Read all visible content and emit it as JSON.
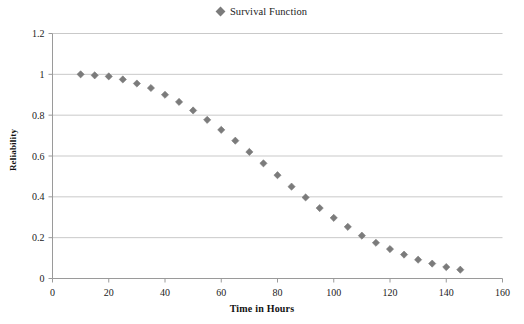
{
  "legend": {
    "entries": [
      {
        "label": "Survival Function",
        "marker": "diamond-marker-icon",
        "color": "#7b7b7b"
      }
    ]
  },
  "axes": {
    "x_title": "Time in Hours",
    "y_title": "Reliability"
  },
  "colors": {
    "marker": "#7b7b7b",
    "gridline": "#c9c9c9",
    "axis": "#9a9a9a",
    "text": "#222222",
    "background": "#ffffff"
  },
  "chart_data": {
    "type": "scatter",
    "title": "",
    "xlabel": "Time in Hours",
    "ylabel": "Reliability",
    "xlim": [
      0,
      160
    ],
    "ylim": [
      0,
      1.2
    ],
    "xticks": [
      0,
      20,
      40,
      60,
      80,
      100,
      120,
      140,
      160
    ],
    "yticks": [
      0,
      0.2,
      0.4,
      0.6,
      0.8,
      1,
      1.2
    ],
    "xtick_labels": [
      "0",
      "20",
      "40",
      "60",
      "80",
      "100",
      "120",
      "140",
      "160"
    ],
    "ytick_labels": [
      "0",
      "0.2",
      "0.4",
      "0.6",
      "0.8",
      "1",
      "1.2"
    ],
    "grid": "horizontal",
    "legend_position": "top-center",
    "series": [
      {
        "name": "Survival Function",
        "marker": "diamond",
        "color": "#7b7b7b",
        "x": [
          10,
          15,
          20,
          25,
          30,
          35,
          40,
          45,
          50,
          55,
          60,
          65,
          70,
          75,
          80,
          85,
          90,
          95,
          100,
          105,
          110,
          115,
          120,
          125,
          130,
          135,
          140,
          145
        ],
        "y": [
          1.0,
          0.995,
          0.99,
          0.975,
          0.955,
          0.933,
          0.9,
          0.865,
          0.823,
          0.777,
          0.728,
          0.675,
          0.62,
          0.564,
          0.506,
          0.45,
          0.397,
          0.345,
          0.297,
          0.253,
          0.21,
          0.175,
          0.144,
          0.117,
          0.092,
          0.073,
          0.056,
          0.043
        ]
      }
    ]
  }
}
